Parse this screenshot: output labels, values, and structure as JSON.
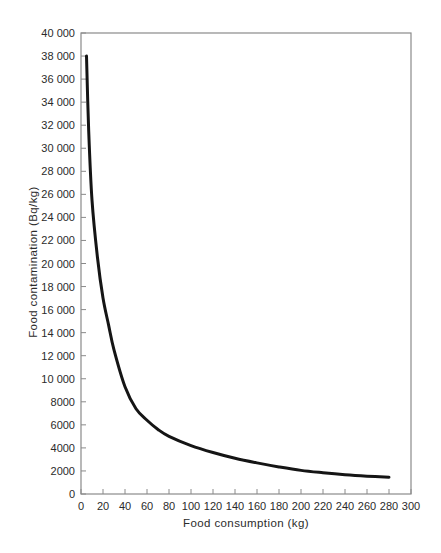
{
  "chart_data": {
    "type": "line",
    "title": "",
    "xlabel": "Food consumption (kg)",
    "ylabel": "Food contamination (Bq/kg)",
    "xlim": [
      0,
      300
    ],
    "ylim": [
      0,
      40000
    ],
    "grid": false,
    "legend": null,
    "x_ticks": [
      0,
      20,
      40,
      60,
      80,
      100,
      120,
      140,
      160,
      180,
      200,
      220,
      240,
      260,
      280,
      300
    ],
    "y_ticks": [
      0,
      2000,
      4000,
      6000,
      8000,
      10000,
      12000,
      14000,
      16000,
      18000,
      20000,
      22000,
      24000,
      26000,
      28000,
      30000,
      32000,
      34000,
      36000,
      38000,
      40000
    ],
    "x_tick_labels": [
      "0",
      "20",
      "40",
      "60",
      "80",
      "100",
      "120",
      "140",
      "160",
      "180",
      "200",
      "220",
      "240",
      "260",
      "280",
      "300"
    ],
    "y_tick_labels": [
      "0",
      "2000",
      "4000",
      "6000",
      "8000",
      "10 000",
      "12 000",
      "14 000",
      "16 000",
      "18 000",
      "20 000",
      "22 000",
      "24 000",
      "26 000",
      "28 000",
      "30 000",
      "32 000",
      "34 000",
      "36 000",
      "38 000",
      "40 000"
    ],
    "series": [
      {
        "name": "Contamination limit curve",
        "color": "#151515",
        "x": [
          5,
          7,
          10,
          15,
          20,
          25,
          30,
          40,
          50,
          60,
          70,
          80,
          100,
          120,
          140,
          160,
          180,
          200,
          220,
          240,
          260,
          280
        ],
        "values": [
          38000,
          31500,
          25500,
          20500,
          17000,
          14700,
          12500,
          9300,
          7400,
          6400,
          5600,
          5000,
          4200,
          3600,
          3100,
          2700,
          2350,
          2050,
          1850,
          1680,
          1550,
          1450
        ]
      }
    ]
  }
}
